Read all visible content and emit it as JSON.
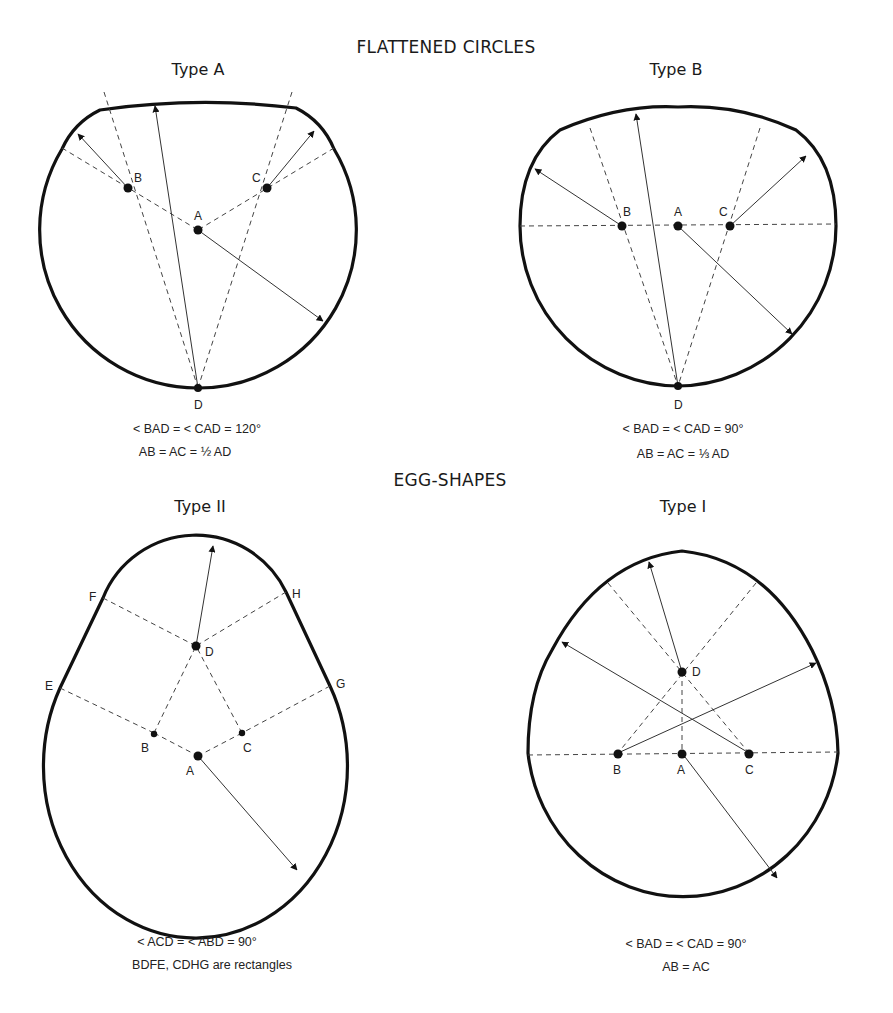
{
  "top_strip_text": "",
  "sections": {
    "flattened": {
      "heading": "FLATTENED CIRCLES",
      "type_a": {
        "title": "Type A",
        "points": {
          "A": "A",
          "B": "B",
          "C": "C",
          "D": "D"
        },
        "caption_line1": "< BAD = < CAD = 120°",
        "caption_line2": "AB = AC = ½ AD"
      },
      "type_b": {
        "title": "Type B",
        "points": {
          "A": "A",
          "B": "B",
          "C": "C",
          "D": "D"
        },
        "caption_line1": "< BAD = < CAD = 90°",
        "caption_line2": "AB = AC = ⅓ AD"
      }
    },
    "egg": {
      "heading": "EGG-SHAPES",
      "type_ii": {
        "title": "Type II",
        "points": {
          "A": "A",
          "B": "B",
          "C": "C",
          "D": "D",
          "E": "E",
          "F": "F",
          "G": "G",
          "H": "H"
        },
        "caption_line1": "< ACD = < ABD = 90°",
        "caption_line2": "BDFE, CDHG are rectangles"
      },
      "type_i": {
        "title": "Type I",
        "points": {
          "A": "A",
          "B": "B",
          "C": "C",
          "D": "D"
        },
        "caption_line1": "< BAD = < CAD = 90°",
        "caption_line2": "AB = AC"
      }
    }
  },
  "colors": {
    "ink": "#111111",
    "background": "#ffffff"
  }
}
